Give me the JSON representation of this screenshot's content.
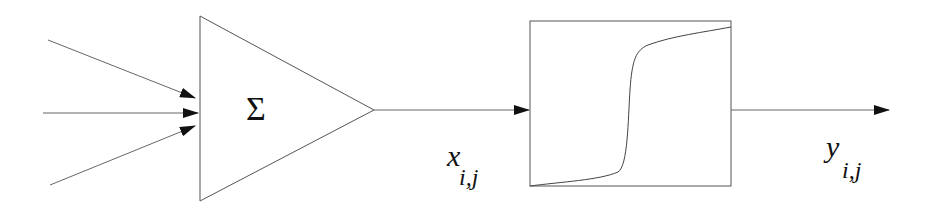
{
  "diagram": {
    "title": "",
    "nodes": [
      {
        "id": "summation",
        "shape": "triangle",
        "label": "Σ"
      },
      {
        "id": "activation",
        "shape": "box",
        "content": "sigmoid curve"
      }
    ],
    "edges": [
      {
        "from": "input-1",
        "to": "summation"
      },
      {
        "from": "input-2",
        "to": "summation"
      },
      {
        "from": "input-3",
        "to": "summation"
      },
      {
        "from": "summation",
        "to": "activation",
        "label": {
          "base": "x",
          "sub": "i,j"
        }
      },
      {
        "from": "activation",
        "to": "output",
        "label": {
          "base": "y",
          "sub": "i,j"
        }
      }
    ],
    "summation_symbol": "Σ",
    "x_label": {
      "base": "x",
      "sub": "i,j"
    },
    "y_label": {
      "base": "y",
      "sub": "i,j"
    },
    "colors": {
      "stroke": "#555555",
      "arrow": "#111111",
      "background": "#ffffff"
    }
  }
}
